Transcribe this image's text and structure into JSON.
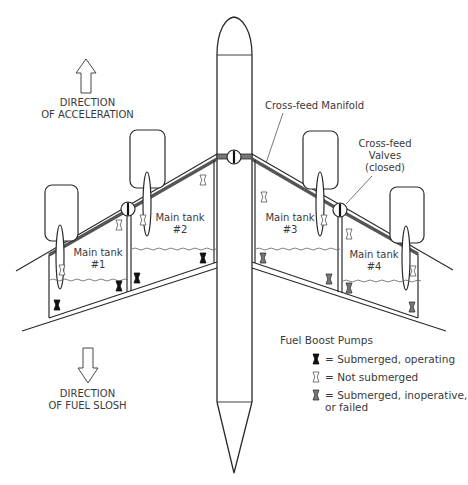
{
  "diagram": {
    "type": "aircraft fuel system schematic (top view)",
    "direction_labels": {
      "acceleration": {
        "line1": "DIRECTION",
        "line2": "OF ACCELERATION",
        "arrow": "up-arrow"
      },
      "slosh": {
        "line1": "DIRECTION",
        "line2": "OF FUEL SLOSH",
        "arrow": "down-arrow"
      }
    },
    "callouts": {
      "manifold": "Cross-feed Manifold",
      "valves": {
        "line1": "Cross-feed",
        "line2": "Valves",
        "line3": "(closed)"
      }
    },
    "tanks": [
      {
        "line1": "Main tank",
        "line2": "#1"
      },
      {
        "line1": "Main tank",
        "line2": "#2"
      },
      {
        "line1": "Main tank",
        "line2": "#3"
      },
      {
        "line1": "Main tank",
        "line2": "#4"
      }
    ],
    "legend": {
      "title": "Fuel Boost Pumps",
      "items": [
        {
          "icon": "pump-submerged-operating-icon",
          "fill": "#111111",
          "label": "= Submerged, operating"
        },
        {
          "icon": "pump-not-submerged-icon",
          "fill": "#ffffff",
          "label": "= Not submerged"
        },
        {
          "icon": "pump-inoperative-icon",
          "fill": "#777777",
          "label": "= Submerged, inoperative,",
          "label2": "or failed"
        }
      ]
    },
    "colors": {
      "line": "#2a2a2a",
      "text": "#3a3a3a",
      "operating": "#111111",
      "failed": "#777777"
    }
  }
}
